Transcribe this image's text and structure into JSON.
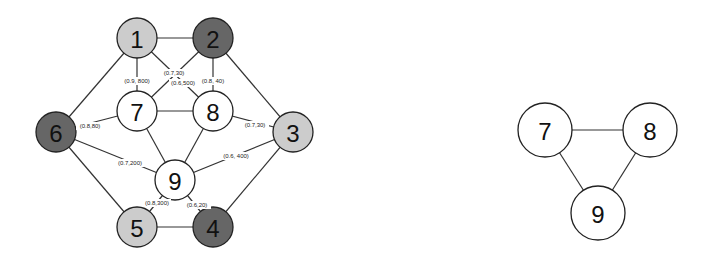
{
  "colors": {
    "light": "#cccccc",
    "dark": "#666666",
    "white": "#ffffff"
  },
  "left_graph": {
    "nodes": [
      {
        "id": "1",
        "x": 137,
        "y": 38,
        "r": 20,
        "fill": "light"
      },
      {
        "id": "2",
        "x": 213,
        "y": 38,
        "r": 20,
        "fill": "dark"
      },
      {
        "id": "3",
        "x": 293,
        "y": 132,
        "r": 20,
        "fill": "light"
      },
      {
        "id": "4",
        "x": 213,
        "y": 227,
        "r": 20,
        "fill": "dark"
      },
      {
        "id": "5",
        "x": 137,
        "y": 227,
        "r": 20,
        "fill": "light"
      },
      {
        "id": "6",
        "x": 56,
        "y": 132,
        "r": 20,
        "fill": "dark"
      },
      {
        "id": "7",
        "x": 137,
        "y": 111,
        "r": 20,
        "fill": "white"
      },
      {
        "id": "8",
        "x": 213,
        "y": 111,
        "r": 20,
        "fill": "white"
      },
      {
        "id": "9",
        "x": 175,
        "y": 180,
        "r": 20,
        "fill": "white"
      }
    ],
    "edges": [
      {
        "from": "1",
        "to": "2",
        "label": ""
      },
      {
        "from": "2",
        "to": "3",
        "label": ""
      },
      {
        "from": "3",
        "to": "4",
        "label": ""
      },
      {
        "from": "4",
        "to": "5",
        "label": ""
      },
      {
        "from": "5",
        "to": "6",
        "label": ""
      },
      {
        "from": "6",
        "to": "1",
        "label": ""
      },
      {
        "from": "7",
        "to": "8",
        "label": ""
      },
      {
        "from": "7",
        "to": "9",
        "label": ""
      },
      {
        "from": "8",
        "to": "9",
        "label": ""
      },
      {
        "from": "1",
        "to": "7",
        "label": "(0.9, 800)",
        "lx": 137,
        "ly": 81
      },
      {
        "from": "2",
        "to": "7",
        "label": "(0.7,30)",
        "lx": 174,
        "ly": 73
      },
      {
        "from": "1",
        "to": "8",
        "label": "(0.6,500)",
        "lx": 183,
        "ly": 83
      },
      {
        "from": "2",
        "to": "8",
        "label": "(0.8, 40)",
        "lx": 213,
        "ly": 81
      },
      {
        "from": "6",
        "to": "7",
        "label": "(0.8,80)",
        "lx": 90,
        "ly": 126
      },
      {
        "from": "3",
        "to": "8",
        "label": "(0.7,30)",
        "lx": 255,
        "ly": 125
      },
      {
        "from": "6",
        "to": "9",
        "label": "(0.7,200)",
        "lx": 130,
        "ly": 163
      },
      {
        "from": "3",
        "to": "9",
        "label": "(0.6, 400)",
        "lx": 236,
        "ly": 156
      },
      {
        "from": "5",
        "to": "9",
        "label": "(0.8,300)",
        "lx": 157,
        "ly": 203
      },
      {
        "from": "4",
        "to": "9",
        "label": "(0.6,20)",
        "lx": 197,
        "ly": 205
      }
    ]
  },
  "right_graph": {
    "nodes": [
      {
        "id": "7",
        "x": 545,
        "y": 130,
        "r": 27,
        "fill": "white"
      },
      {
        "id": "8",
        "x": 650,
        "y": 130,
        "r": 27,
        "fill": "white"
      },
      {
        "id": "9",
        "x": 598,
        "y": 213,
        "r": 27,
        "fill": "white"
      }
    ],
    "edges": [
      {
        "from": "7",
        "to": "8",
        "label": ""
      },
      {
        "from": "7",
        "to": "9",
        "label": ""
      },
      {
        "from": "8",
        "to": "9",
        "label": ""
      }
    ]
  }
}
